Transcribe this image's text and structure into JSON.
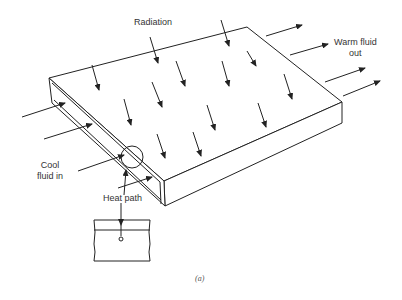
{
  "diagram": {
    "labels": {
      "radiation": "Radiation",
      "warm_out": "Warm fluid\nout",
      "cool_in": "Cool\nfluid in",
      "heat_path": "Heat path"
    },
    "caption": "(a)",
    "colors": {
      "stroke": "#222222",
      "background": "#ffffff"
    }
  }
}
